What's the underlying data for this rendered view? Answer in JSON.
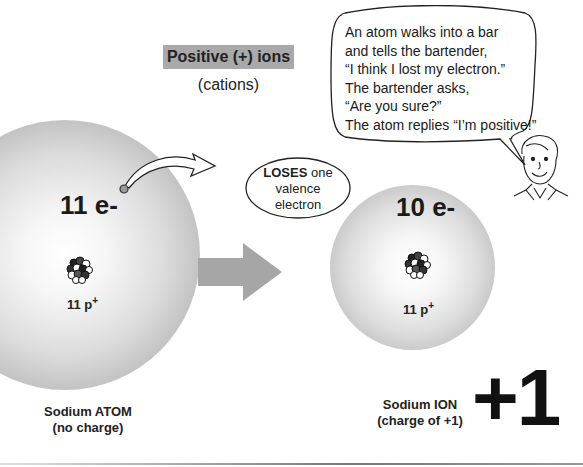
{
  "header": {
    "title": "Positive (+) ions",
    "subtitle": "(cations)"
  },
  "speech_bubble": {
    "lines": [
      "An atom walks into a bar",
      "and tells the bartender,",
      "“I think I lost my electron.”",
      "The bartender asks,",
      "“Are you sure?”",
      "The atom replies “I’m positive!”"
    ]
  },
  "atom": {
    "electrons": "11 e-",
    "protons_num": "11 p",
    "protons_sup": "+",
    "caption_line1": "Sodium ATOM",
    "caption_line2": "(no charge)"
  },
  "callout": {
    "bold": "LOSES",
    "rest1": " one",
    "line2": "valence",
    "line3": "electron"
  },
  "ion": {
    "electrons": "10 e-",
    "protons_num": "11 p",
    "protons_sup": "+",
    "caption_line1": "Sodium ION",
    "caption_line2": "(charge of +1)",
    "charge": "+1"
  },
  "colors": {
    "title_bg": "#a9a9a9",
    "arrow": "#a6a6a6",
    "text": "#222222"
  }
}
